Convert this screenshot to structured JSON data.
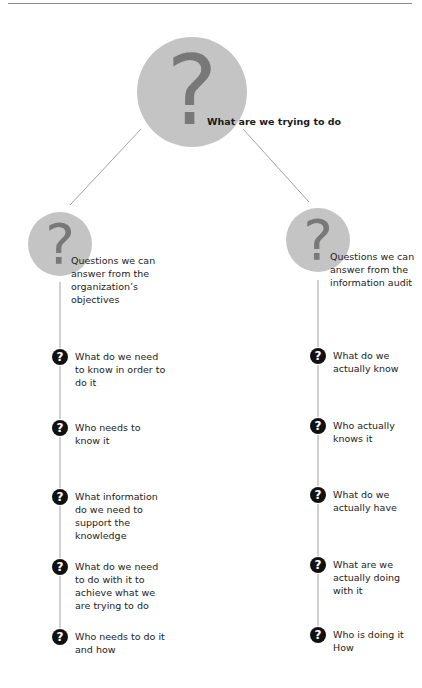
{
  "diagram": {
    "root": {
      "glyph": "?",
      "label": "What are we trying to do"
    },
    "left_branch": {
      "glyph": "?",
      "label": "Questions we can answer from the organization’s objectives",
      "items": [
        {
          "glyph": "?",
          "text": "What do we need to know in order to do it"
        },
        {
          "glyph": "?",
          "text": "Who needs to know it"
        },
        {
          "glyph": "?",
          "text": "What information do we need to support the knowledge"
        },
        {
          "glyph": "?",
          "text": "What do we need to do with it to achieve what we are trying to do"
        },
        {
          "glyph": "?",
          "text": "Who needs to do it and how"
        }
      ]
    },
    "right_branch": {
      "glyph": "?",
      "label": "Questions we can answer from the information audit",
      "items": [
        {
          "glyph": "?",
          "text": "What do we actually know"
        },
        {
          "glyph": "?",
          "text": "Who actually knows it"
        },
        {
          "glyph": "?",
          "text": "What do we actually have"
        },
        {
          "glyph": "?",
          "text": "What are we actually doing with it"
        },
        {
          "glyph": "?",
          "text": "Who is doing it How"
        }
      ]
    },
    "colors": {
      "circle_fill": "#c4c4c4",
      "circle_glyph": "#787878",
      "icon_fill": "#111111",
      "line": "#8a8a8a"
    }
  }
}
